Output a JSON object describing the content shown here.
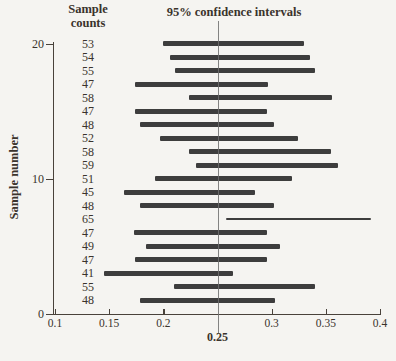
{
  "title": "95% confidence intervals",
  "column_header": "Sample\ncounts",
  "y_axis": {
    "label": "Sample number",
    "tick_labels": [
      "20",
      "10",
      "0"
    ],
    "tick_values": [
      20,
      10,
      0
    ]
  },
  "x_axis": {
    "tick_labels": [
      "0.1",
      "0.15",
      "0.2",
      "0.3",
      "0.35",
      "0.4"
    ],
    "tick_values": [
      0.1,
      0.15,
      0.2,
      0.3,
      0.35,
      0.4
    ],
    "highlight_label": "0.25",
    "highlight_value": 0.25
  },
  "colors": {
    "bar": "#3d3d3d",
    "text": "#3a332c",
    "axis": "#49423b",
    "reference_line": "#6e6e6e",
    "background": "#f5f4f1"
  },
  "chart_data": {
    "type": "bar",
    "orientation": "horizontal-interval",
    "title": "95% confidence intervals",
    "xlabel": "",
    "ylabel": "Sample number",
    "xlim": [
      0.1,
      0.4
    ],
    "ylim": [
      0,
      20
    ],
    "reference_value": 0.25,
    "grid": false,
    "samples": [
      {
        "sample_number": 20,
        "count": 53,
        "ci_low": 0.2,
        "ci_high": 0.33,
        "thin": false
      },
      {
        "sample_number": 19,
        "count": 54,
        "ci_low": 0.206,
        "ci_high": 0.335,
        "thin": false
      },
      {
        "sample_number": 18,
        "count": 55,
        "ci_low": 0.211,
        "ci_high": 0.34,
        "thin": false
      },
      {
        "sample_number": 17,
        "count": 47,
        "ci_low": 0.174,
        "ci_high": 0.297,
        "thin": false
      },
      {
        "sample_number": 16,
        "count": 58,
        "ci_low": 0.224,
        "ci_high": 0.356,
        "thin": false
      },
      {
        "sample_number": 15,
        "count": 47,
        "ci_low": 0.174,
        "ci_high": 0.296,
        "thin": false
      },
      {
        "sample_number": 14,
        "count": 48,
        "ci_low": 0.178,
        "ci_high": 0.302,
        "thin": false
      },
      {
        "sample_number": 13,
        "count": 52,
        "ci_low": 0.197,
        "ci_high": 0.324,
        "thin": false
      },
      {
        "sample_number": 12,
        "count": 58,
        "ci_low": 0.224,
        "ci_high": 0.355,
        "thin": false
      },
      {
        "sample_number": 11,
        "count": 59,
        "ci_low": 0.23,
        "ci_high": 0.361,
        "thin": false
      },
      {
        "sample_number": 10,
        "count": 51,
        "ci_low": 0.192,
        "ci_high": 0.319,
        "thin": false
      },
      {
        "sample_number": 9,
        "count": 45,
        "ci_low": 0.164,
        "ci_high": 0.285,
        "thin": false
      },
      {
        "sample_number": 8,
        "count": 48,
        "ci_low": 0.178,
        "ci_high": 0.302,
        "thin": false
      },
      {
        "sample_number": 7,
        "count": 65,
        "ci_low": 0.258,
        "ci_high": 0.392,
        "thin": true
      },
      {
        "sample_number": 6,
        "count": 47,
        "ci_low": 0.173,
        "ci_high": 0.296,
        "thin": false
      },
      {
        "sample_number": 5,
        "count": 49,
        "ci_low": 0.184,
        "ci_high": 0.308,
        "thin": false
      },
      {
        "sample_number": 4,
        "count": 47,
        "ci_low": 0.174,
        "ci_high": 0.296,
        "thin": false
      },
      {
        "sample_number": 3,
        "count": 41,
        "ci_low": 0.145,
        "ci_high": 0.264,
        "thin": false
      },
      {
        "sample_number": 2,
        "count": 55,
        "ci_low": 0.21,
        "ci_high": 0.34,
        "thin": false
      },
      {
        "sample_number": 1,
        "count": 48,
        "ci_low": 0.178,
        "ci_high": 0.303,
        "thin": false
      }
    ]
  }
}
